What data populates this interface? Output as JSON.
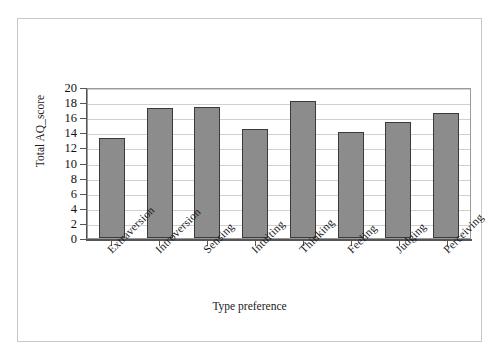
{
  "chart_data": {
    "type": "bar",
    "title": "",
    "xlabel": "Type preference",
    "ylabel": "Total AQ_score",
    "categories": [
      "Extraversion",
      "Introversion",
      "Sensing",
      "Intuiting",
      "Thinking",
      "Feeling",
      "Judging",
      "Perceiving"
    ],
    "values": [
      13.3,
      17.2,
      17.3,
      14.4,
      18.2,
      14.0,
      15.4,
      16.5
    ],
    "ylim": [
      0,
      20
    ],
    "yticks": [
      0,
      2,
      4,
      6,
      8,
      10,
      12,
      14,
      16,
      18,
      20
    ],
    "ytick_labels": [
      "0",
      "2",
      "4",
      "6",
      "8",
      "10",
      "12",
      "14",
      "16",
      "18",
      "20"
    ],
    "grid": true,
    "grid_axis": "y",
    "legend": false,
    "bar_color": "#8c8c8c",
    "bar_edge_color": "#3a3a3a",
    "grid_color": "#d0d0d0",
    "axis_color": "#555555",
    "background": "#ffffff",
    "frame_color": "#c9c9c9"
  }
}
